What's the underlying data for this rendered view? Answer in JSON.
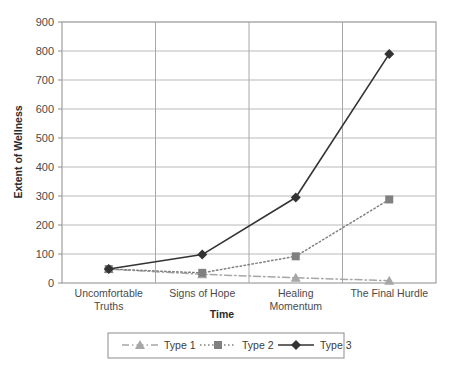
{
  "chart_data": {
    "type": "line",
    "title": "",
    "xlabel": "Time",
    "ylabel": "Extent of Wellness",
    "categories": [
      "Uncomfortable Truths",
      "Signs of Hope",
      "Healing Momentum",
      "The Final Hurdle"
    ],
    "category_lines": [
      [
        "Uncomfortable",
        "Truths"
      ],
      [
        "Signs of Hope",
        ""
      ],
      [
        "Healing",
        "Momentum"
      ],
      [
        "The Final Hurdle",
        ""
      ]
    ],
    "ylim": [
      0,
      900
    ],
    "yticks": [
      0,
      100,
      200,
      300,
      400,
      500,
      600,
      700,
      800,
      900
    ],
    "ytick_labels": [
      "0",
      "100",
      "200",
      "300",
      "400",
      "500",
      "600",
      "700",
      "800",
      "900"
    ],
    "grid": "horizontal-and-vertical",
    "legend_position": "bottom",
    "series": [
      {
        "name": "Type 1",
        "values": [
          48,
          30,
          18,
          8
        ],
        "color": "#a6a6a6",
        "marker": "triangle",
        "dash": "dash-dot"
      },
      {
        "name": "Type 2",
        "values": [
          48,
          35,
          92,
          288
        ],
        "color": "#808080",
        "marker": "square",
        "dash": "dotted"
      },
      {
        "name": "Type 3",
        "values": [
          48,
          98,
          295,
          790
        ],
        "color": "#333333",
        "marker": "diamond",
        "dash": "solid"
      }
    ]
  },
  "legend": {
    "entries": [
      {
        "label": "Type 1"
      },
      {
        "label": "Type 2"
      },
      {
        "label": "Type 3"
      }
    ]
  }
}
